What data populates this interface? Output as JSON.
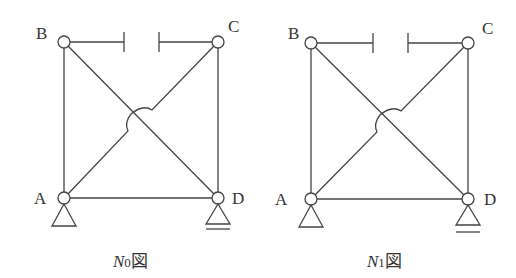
{
  "diagrams": [
    {
      "id": "N0",
      "caption": {
        "symbol": "N",
        "subscript": "0",
        "suffix": "図"
      },
      "nodes": {
        "A": "A",
        "B": "B",
        "C": "C",
        "D": "D"
      },
      "supports": {
        "A": "pin",
        "D": "roller"
      }
    },
    {
      "id": "N1",
      "caption": {
        "symbol": "N",
        "subscript": "1",
        "suffix": "図"
      },
      "nodes": {
        "A": "A",
        "B": "B",
        "C": "C",
        "D": "D"
      },
      "supports": {
        "A": "pin",
        "D": "roller"
      }
    }
  ],
  "colors": {
    "line": "#444444",
    "text": "#333333",
    "background": "#ffffff"
  }
}
